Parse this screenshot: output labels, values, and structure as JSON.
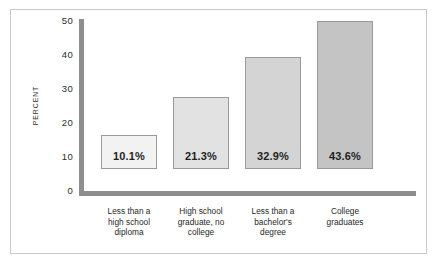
{
  "chart_data": {
    "type": "bar",
    "title": "",
    "xlabel": "",
    "ylabel": "PERCENT",
    "ylim": [
      0,
      50
    ],
    "yticks": [
      "0",
      "10",
      "20",
      "30",
      "40",
      "50"
    ],
    "grid": false,
    "legend": false,
    "categories": [
      "Less than a high school diploma",
      "High school graduate, no college",
      "Less than a bachelor's degree",
      "College graduates"
    ],
    "category_lines": [
      [
        "Less than a",
        "high school",
        "diploma"
      ],
      [
        "High school",
        "graduate, no",
        "college"
      ],
      [
        "Less than a",
        "bachelor's",
        "degree"
      ],
      [
        "College",
        "graduates"
      ]
    ],
    "values": [
      10.1,
      21.3,
      32.9,
      43.6
    ],
    "value_labels": [
      "10.1%",
      "21.3%",
      "32.9%",
      "43.6%"
    ],
    "bar_colors": [
      "#f2f2f2",
      "#e2e2e2",
      "#d4d4d4",
      "#c4c4c4"
    ],
    "bar_border_color": "#9a9a9a",
    "axis_color": "#8e8e8e",
    "text_color": "#1f1f1f",
    "background": "#ffffff",
    "frame_color": "#c9c9c9"
  }
}
